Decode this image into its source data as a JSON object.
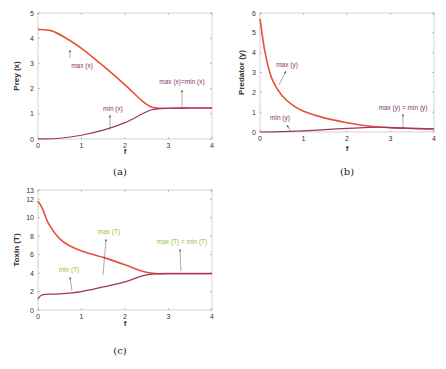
{
  "chart_data": [
    {
      "id": "a",
      "type": "line",
      "caption": "(a)",
      "xlabel": "f",
      "ylabel": "Prey (x)",
      "xlim": [
        0,
        4
      ],
      "ylim": [
        0,
        5
      ],
      "xticks": [
        "0",
        "1",
        "2",
        "3",
        "4"
      ],
      "yticks": [
        "0",
        "1",
        "2",
        "3",
        "4",
        "5"
      ],
      "grid": false,
      "series": [
        {
          "name": "max (x)",
          "x": [
            0,
            0.3,
            0.6,
            1.0,
            1.5,
            2.0,
            2.4,
            2.6,
            2.8,
            3.0,
            3.5,
            4.0
          ],
          "y": [
            4.35,
            4.3,
            4.05,
            3.6,
            2.9,
            2.15,
            1.5,
            1.27,
            1.22,
            1.22,
            1.23,
            1.23
          ]
        },
        {
          "name": "min (x)",
          "x": [
            0,
            0.5,
            1.0,
            1.5,
            2.0,
            2.4,
            2.6,
            2.8,
            3.0,
            3.5,
            4.0
          ],
          "y": [
            0.0,
            0.03,
            0.15,
            0.35,
            0.65,
            1.0,
            1.15,
            1.2,
            1.22,
            1.23,
            1.23
          ]
        }
      ],
      "annotations": [
        "max (x)",
        "min (x)",
        "max (x)=min (x)"
      ],
      "annotation_color": "#8b2f6b",
      "line_colors": {
        "max": "#e8503a",
        "min": "#9b3566"
      }
    },
    {
      "id": "b",
      "type": "line",
      "caption": "(b)",
      "xlabel": "f",
      "ylabel": "Predator (y)",
      "xlim": [
        0,
        4
      ],
      "ylim": [
        0,
        6
      ],
      "xticks": [
        "0",
        "1",
        "2",
        "3",
        "4"
      ],
      "yticks": [
        "0",
        "1",
        "2",
        "3",
        "4",
        "5",
        "6"
      ],
      "grid": false,
      "series": [
        {
          "name": "max (y)",
          "x": [
            0,
            0.1,
            0.2,
            0.3,
            0.5,
            0.75,
            1.0,
            1.5,
            2.0,
            2.5,
            3.0,
            3.5,
            4.0
          ],
          "y": [
            5.7,
            4.2,
            3.2,
            2.55,
            1.85,
            1.35,
            1.05,
            0.7,
            0.47,
            0.3,
            0.22,
            0.18,
            0.15
          ]
        },
        {
          "name": "min (y)",
          "x": [
            0,
            0.5,
            1.0,
            1.5,
            2.0,
            2.5,
            2.8,
            3.0,
            3.5,
            4.0
          ],
          "y": [
            0.0,
            0.02,
            0.06,
            0.12,
            0.18,
            0.23,
            0.24,
            0.22,
            0.18,
            0.15
          ]
        }
      ],
      "annotations": [
        "max (y)",
        "min (y)",
        "max (y) = min (y)"
      ],
      "annotation_color": "#8b2f6b",
      "line_colors": {
        "max": "#e8503a",
        "min": "#9b3566"
      }
    },
    {
      "id": "c",
      "type": "line",
      "caption": "(c)",
      "xlabel": "f",
      "ylabel": "Toxin (T)",
      "xlim": [
        0,
        4
      ],
      "ylim": [
        0,
        13
      ],
      "xticks": [
        "0",
        "1",
        "2",
        "3",
        "4"
      ],
      "yticks": [
        "0",
        "2",
        "4",
        "6",
        "8",
        "10",
        "12",
        "13"
      ],
      "grid": false,
      "series": [
        {
          "name": "max (T)",
          "x": [
            0,
            0.1,
            0.25,
            0.5,
            0.75,
            1.0,
            1.5,
            2.0,
            2.4,
            2.7,
            3.0,
            3.5,
            4.0
          ],
          "y": [
            11.8,
            11.0,
            9.3,
            7.7,
            6.9,
            6.4,
            5.7,
            4.9,
            4.2,
            3.95,
            3.95,
            3.95,
            3.95
          ]
        },
        {
          "name": "min (T)",
          "x": [
            0,
            0.05,
            0.15,
            0.5,
            1.0,
            1.5,
            2.0,
            2.4,
            2.7,
            3.0,
            3.5,
            4.0
          ],
          "y": [
            1.2,
            1.5,
            1.7,
            1.75,
            2.0,
            2.5,
            3.05,
            3.7,
            3.92,
            3.95,
            3.95,
            3.95
          ]
        }
      ],
      "annotations": [
        "max (T)",
        "min (T)",
        "max (T) = min (T)"
      ],
      "annotation_color": "#8fbf3a",
      "line_colors": {
        "max": "#e8503a",
        "min": "#9b3566"
      }
    }
  ]
}
